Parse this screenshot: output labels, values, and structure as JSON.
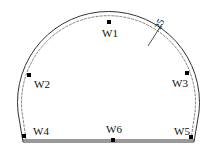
{
  "diagram": {
    "type": "tunnel cross-section with monitoring points",
    "dimension_label": "25",
    "points": [
      {
        "id": "W1",
        "label": "W1"
      },
      {
        "id": "W2",
        "label": "W2"
      },
      {
        "id": "W3",
        "label": "W3"
      },
      {
        "id": "W4",
        "label": "W4"
      },
      {
        "id": "W5",
        "label": "W5"
      },
      {
        "id": "W6",
        "label": "W6"
      }
    ]
  }
}
